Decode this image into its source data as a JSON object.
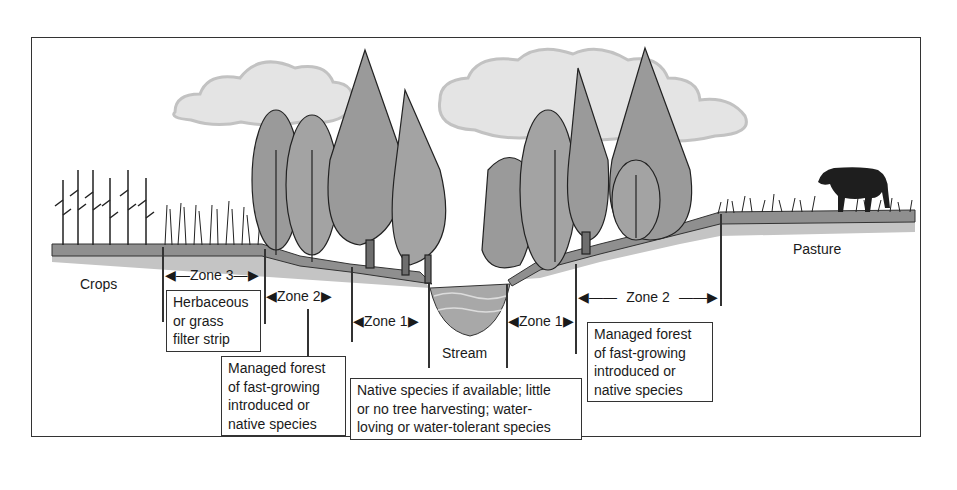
{
  "diagram": {
    "labels": {
      "crops": "Crops",
      "pasture": "Pasture",
      "stream": "Stream"
    },
    "zones": {
      "zone3": "Zone 3",
      "zone2_left": "Zone 2",
      "zone1_left": "Zone 1",
      "zone1_right": "Zone 1",
      "zone2_right": "Zone 2"
    },
    "descriptions": {
      "zone3": [
        "Herbaceous",
        "or grass",
        "filter strip"
      ],
      "zone2_left": [
        "Managed forest",
        "of fast-growing",
        "introduced or",
        "native species"
      ],
      "zone1": [
        "Native species if available; little",
        "or no tree harvesting; water-",
        "loving or water-tolerant species"
      ],
      "zone2_right": [
        "Managed forest",
        "of fast-growing",
        "introduced or",
        "native species"
      ]
    },
    "colors": {
      "ground": "#8f8f8f",
      "ground_shadow": "#c4c4c4",
      "tree_fill": "#9a9a9a",
      "tree_dark": "#6e6e6e",
      "cloud": "#d6d6d6",
      "water": "#a8a8a8",
      "outline": "#222222"
    }
  }
}
